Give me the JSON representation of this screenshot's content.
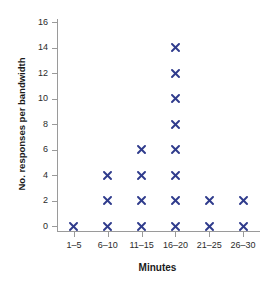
{
  "chart_data": {
    "type": "scatter",
    "title": "",
    "subtitle": "",
    "xlabel": "Minutes",
    "ylabel": "No. responses per bandwidth",
    "categories": [
      "1–5",
      "6–10",
      "11–15",
      "16–20",
      "21–25",
      "26–30"
    ],
    "ytick_labels": [
      "0",
      "2",
      "4",
      "6",
      "8",
      "10",
      "12",
      "14",
      "16"
    ],
    "ytick_values": [
      0,
      2,
      4,
      6,
      8,
      10,
      12,
      14,
      16
    ],
    "ylim": [
      0,
      16
    ],
    "grid": false,
    "legend": null,
    "marker": {
      "glyph": "×",
      "name": "cross-marker",
      "color": "#2f3b8c"
    },
    "axis_color": "#9a9a9a",
    "background": "#ffffff",
    "series": [
      {
        "name": "responses",
        "points": [
          {
            "category": "1–5",
            "x": 0,
            "y": 0
          },
          {
            "category": "6–10",
            "x": 1,
            "y": 0
          },
          {
            "category": "6–10",
            "x": 1,
            "y": 2
          },
          {
            "category": "6–10",
            "x": 1,
            "y": 4
          },
          {
            "category": "11–15",
            "x": 2,
            "y": 0
          },
          {
            "category": "11–15",
            "x": 2,
            "y": 2
          },
          {
            "category": "11–15",
            "x": 2,
            "y": 4
          },
          {
            "category": "11–15",
            "x": 2,
            "y": 6
          },
          {
            "category": "16–20",
            "x": 3,
            "y": 0
          },
          {
            "category": "16–20",
            "x": 3,
            "y": 2
          },
          {
            "category": "16–20",
            "x": 3,
            "y": 4
          },
          {
            "category": "16–20",
            "x": 3,
            "y": 6
          },
          {
            "category": "16–20",
            "x": 3,
            "y": 8
          },
          {
            "category": "16–20",
            "x": 3,
            "y": 10
          },
          {
            "category": "16–20",
            "x": 3,
            "y": 12
          },
          {
            "category": "16–20",
            "x": 3,
            "y": 14
          },
          {
            "category": "21–25",
            "x": 4,
            "y": 0
          },
          {
            "category": "21–25",
            "x": 4,
            "y": 2
          },
          {
            "category": "26–30",
            "x": 5,
            "y": 0
          },
          {
            "category": "26–30",
            "x": 5,
            "y": 2
          }
        ]
      }
    ],
    "column_counts": [
      1,
      3,
      4,
      8,
      2,
      2
    ]
  }
}
